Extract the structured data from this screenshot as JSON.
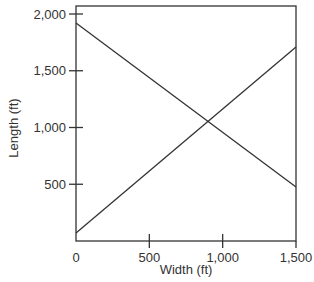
{
  "chart_data": {
    "type": "line",
    "title": "",
    "xlabel": "Width (ft)",
    "ylabel": "Length (ft)",
    "xlim": [
      0,
      1500
    ],
    "ylim": [
      0,
      2075
    ],
    "grid": false,
    "legend": null,
    "x_ticks": [
      0,
      500,
      1000,
      1500
    ],
    "x_tick_labels": [
      "0",
      "500",
      "1,000",
      "1,500"
    ],
    "y_ticks": [
      500,
      1000,
      1500,
      2000
    ],
    "y_tick_labels": [
      "500",
      "1,000",
      "1,500",
      "2,000"
    ],
    "series": [
      {
        "name": "decreasing-line",
        "x": [
          0,
          1500
        ],
        "y": [
          1920,
          475
        ]
      },
      {
        "name": "increasing-line",
        "x": [
          0,
          1500
        ],
        "y": [
          70,
          1710
        ]
      }
    ],
    "intersection": {
      "x": 895,
      "y": 1045
    }
  },
  "colors": {
    "line": "#333333",
    "axis": "#333333",
    "background": "#ffffff"
  }
}
